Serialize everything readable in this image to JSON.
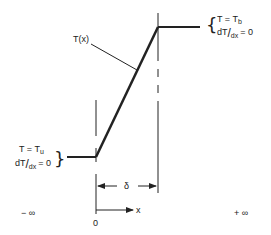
{
  "diagram": {
    "type": "temperature-profile",
    "curve_label": "T(x)",
    "upstream_condition": {
      "line1": "T = T",
      "line1_sub": "u",
      "line2_d": "dT",
      "line2_slash": "/",
      "line2_dx": "dx",
      "line2_eq": "= 0"
    },
    "downstream_condition": {
      "line1": "T = T",
      "line1_sub": "b",
      "line2_d": "dT",
      "line2_slash": "/",
      "line2_dx": "dx",
      "line2_eq": "= 0"
    },
    "thickness_label": "δ",
    "axis": {
      "origin_label": "0",
      "x_label": "x",
      "left_limit": "− ∞",
      "right_limit": "+ ∞"
    },
    "colors": {
      "ink": "#222222"
    }
  }
}
